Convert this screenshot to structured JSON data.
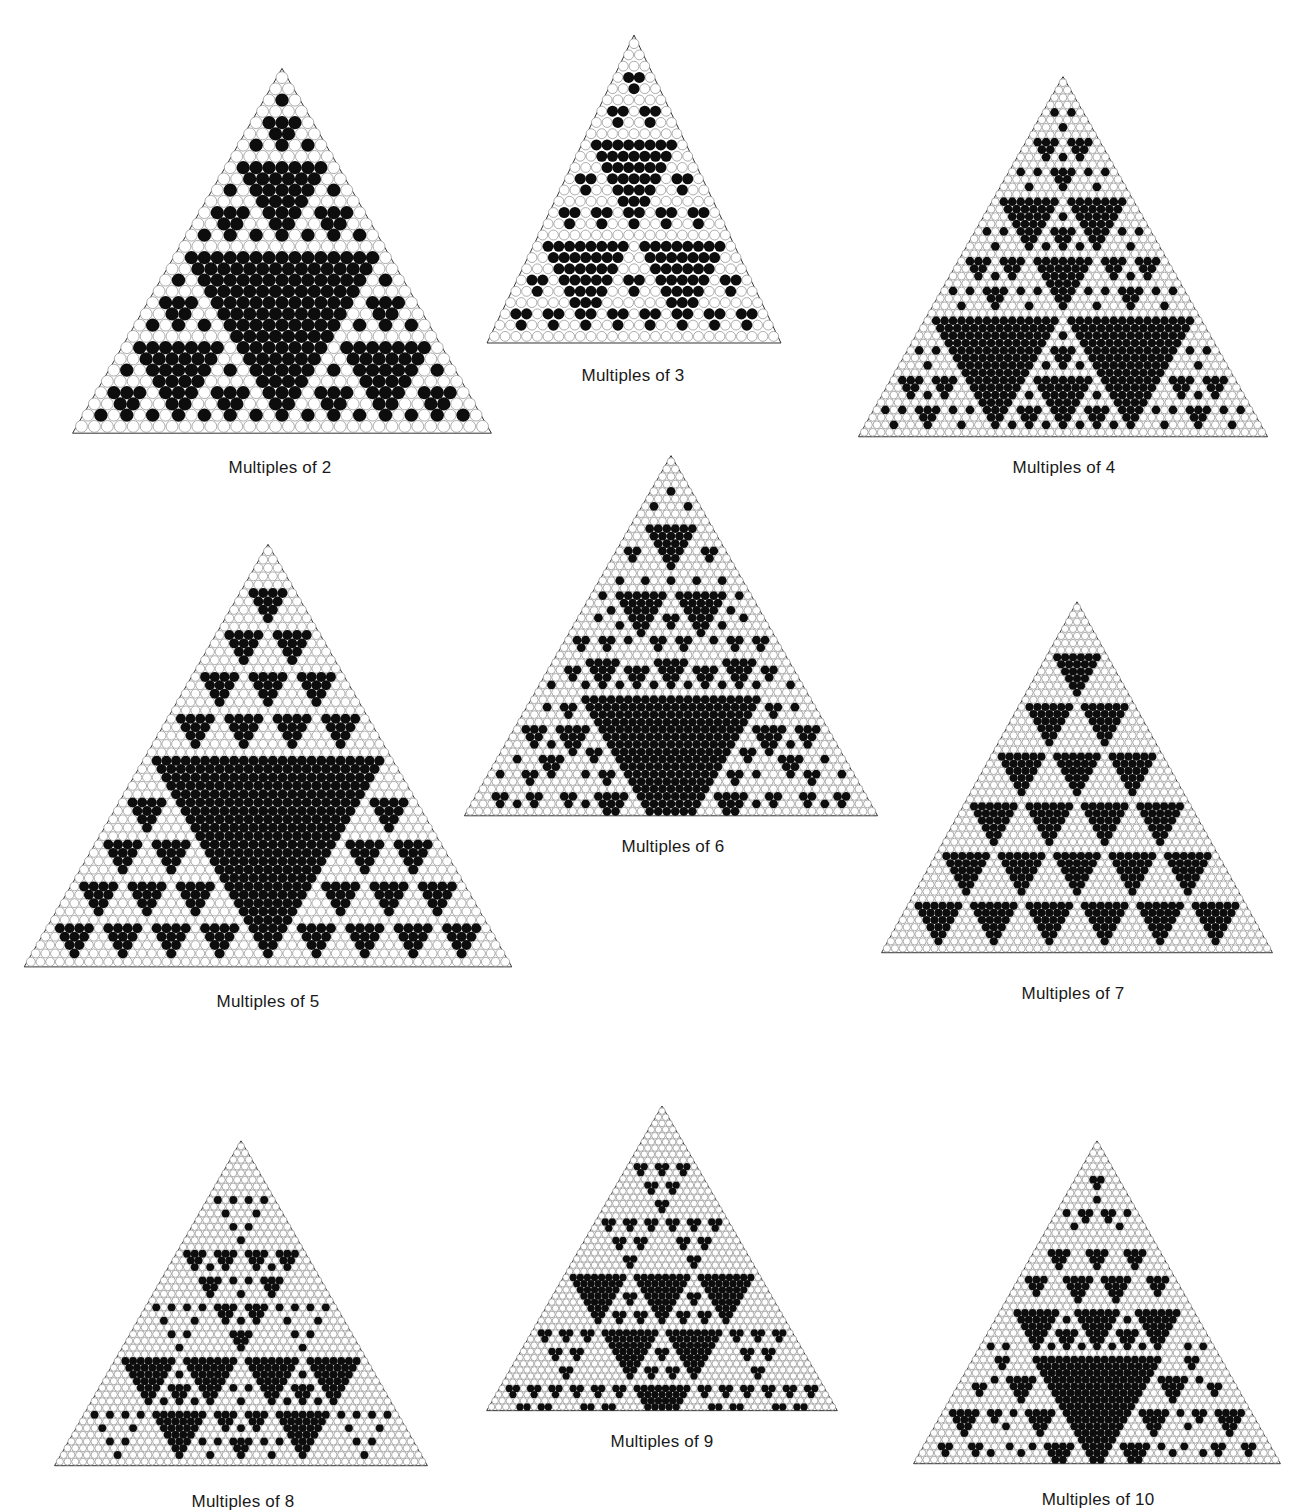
{
  "figure": {
    "colors": {
      "background": "#ffffff",
      "filled": "#0d0d0d",
      "empty_fill": "#ffffff",
      "empty_stroke": "#8a8a8a",
      "outline": "#333333"
    }
  },
  "panels": [
    {
      "id": "mult-2",
      "modulus": 2,
      "rows": 32,
      "apex": [
        282,
        72
      ],
      "base_y": 432,
      "half_width": 207,
      "caption": "Multiples of 2",
      "caption_pos": [
        280,
        470
      ]
    },
    {
      "id": "mult-3",
      "modulus": 3,
      "rows": 27,
      "apex": [
        634,
        38
      ],
      "base_y": 342,
      "half_width": 145,
      "caption": "Multiples of 3",
      "caption_pos": [
        633,
        378
      ]
    },
    {
      "id": "mult-4",
      "modulus": 4,
      "rows": 48,
      "apex": [
        1063,
        79
      ],
      "base_y": 436,
      "half_width": 203,
      "caption": "Multiples of 4",
      "caption_pos": [
        1064,
        470
      ]
    },
    {
      "id": "mult-5",
      "modulus": 5,
      "rows": 50,
      "apex": [
        268,
        547
      ],
      "base_y": 966,
      "half_width": 242,
      "caption": "Multiples of 5",
      "caption_pos": [
        268,
        1004
      ]
    },
    {
      "id": "mult-6",
      "modulus": 6,
      "rows": 48,
      "apex": [
        671,
        458
      ],
      "base_y": 815,
      "half_width": 205,
      "caption": "Multiples of 6",
      "caption_pos": [
        673,
        849
      ]
    },
    {
      "id": "mult-7",
      "modulus": 7,
      "rows": 49,
      "apex": [
        1077,
        604
      ],
      "base_y": 952,
      "half_width": 194,
      "caption": "Multiples of 7",
      "caption_pos": [
        1073,
        996
      ]
    },
    {
      "id": "mult-8",
      "modulus": 8,
      "rows": 48,
      "apex": [
        241,
        1143
      ],
      "base_y": 1465,
      "half_width": 185,
      "caption": "Multiples of 8",
      "caption_pos": [
        243,
        1504
      ]
    },
    {
      "id": "mult-9",
      "modulus": 9,
      "rows": 49,
      "apex": [
        662,
        1108
      ],
      "base_y": 1410,
      "half_width": 174,
      "caption": "Multiples of 9",
      "caption_pos": [
        662,
        1444
      ]
    },
    {
      "id": "mult-10",
      "modulus": 10,
      "rows": 48,
      "apex": [
        1097,
        1143
      ],
      "base_y": 1463,
      "half_width": 182,
      "caption": "Multiples of 10",
      "caption_pos": [
        1098,
        1502
      ]
    }
  ]
}
